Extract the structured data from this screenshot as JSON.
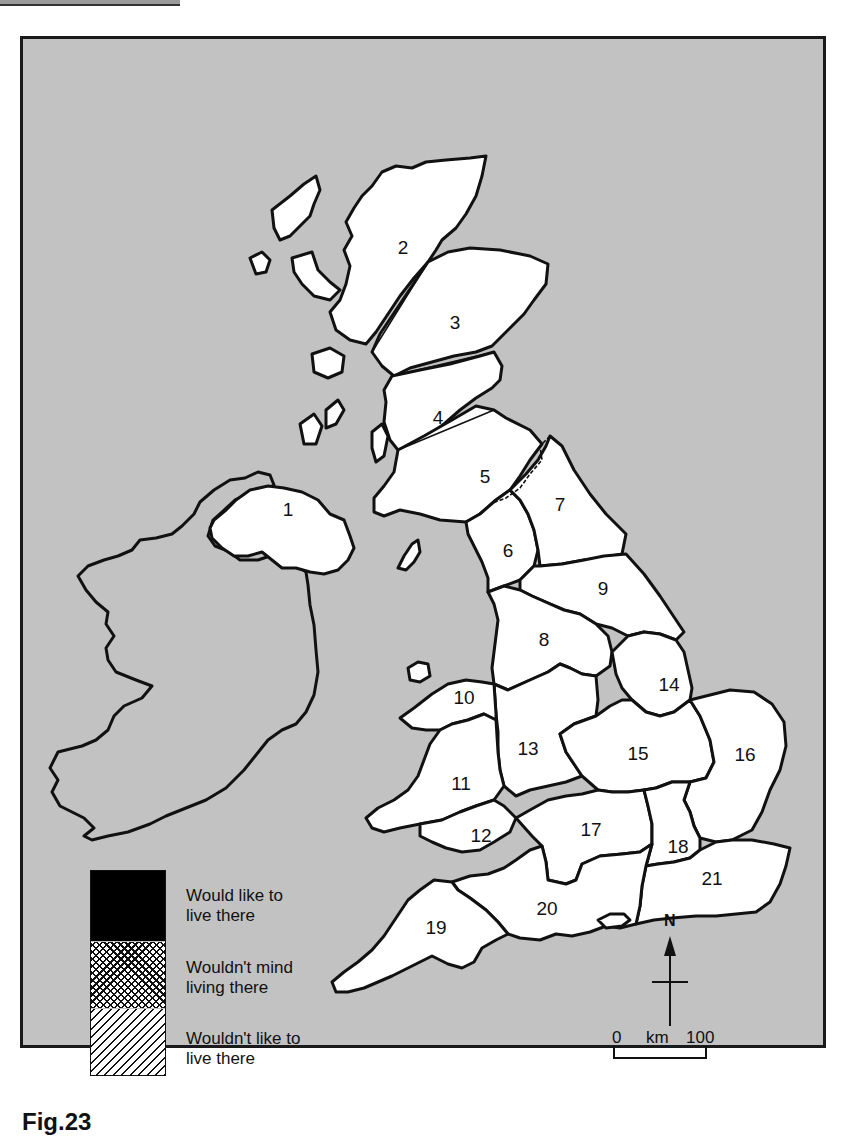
{
  "map": {
    "background_sea_color": "#c2c2c2",
    "land_color": "#ffffff",
    "regions": [
      {
        "id": "1",
        "x": 288,
        "y": 510
      },
      {
        "id": "2",
        "x": 403,
        "y": 248
      },
      {
        "id": "3",
        "x": 455,
        "y": 323
      },
      {
        "id": "4",
        "x": 438,
        "y": 418
      },
      {
        "id": "5",
        "x": 485,
        "y": 477
      },
      {
        "id": "6",
        "x": 508,
        "y": 551
      },
      {
        "id": "7",
        "x": 560,
        "y": 505
      },
      {
        "id": "8",
        "x": 544,
        "y": 640
      },
      {
        "id": "9",
        "x": 603,
        "y": 589
      },
      {
        "id": "10",
        "x": 464,
        "y": 698
      },
      {
        "id": "11",
        "x": 461,
        "y": 784
      },
      {
        "id": "12",
        "x": 481,
        "y": 836
      },
      {
        "id": "13",
        "x": 528,
        "y": 749
      },
      {
        "id": "14",
        "x": 669,
        "y": 685
      },
      {
        "id": "15",
        "x": 638,
        "y": 754
      },
      {
        "id": "16",
        "x": 745,
        "y": 755
      },
      {
        "id": "17",
        "x": 591,
        "y": 830
      },
      {
        "id": "18",
        "x": 678,
        "y": 847
      },
      {
        "id": "19",
        "x": 436,
        "y": 928
      },
      {
        "id": "20",
        "x": 547,
        "y": 909
      },
      {
        "id": "21",
        "x": 712,
        "y": 879
      }
    ]
  },
  "legend": {
    "items": [
      {
        "label_line1": "Would like to",
        "label_line2": "live there",
        "pattern": "solid-black"
      },
      {
        "label_line1": "Wouldn't mind",
        "label_line2": "living there",
        "pattern": "cross-hatch"
      },
      {
        "label_line1": "Wouldn't like to",
        "label_line2": "live there",
        "pattern": "diagonal-hatch"
      }
    ]
  },
  "north_arrow": {
    "label": "N"
  },
  "scale_bar": {
    "start": "0",
    "unit": "km",
    "end": "100"
  },
  "caption": {
    "text": "Fig.23"
  }
}
